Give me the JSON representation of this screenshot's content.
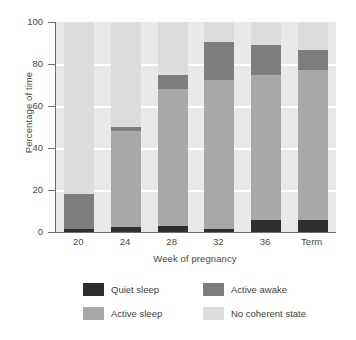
{
  "chart_data": {
    "type": "bar",
    "subtype": "stacked-bar",
    "title": "",
    "xlabel": "Week of pregnancy",
    "ylabel": "Percentage of time",
    "categories": [
      "20",
      "24",
      "28",
      "32",
      "36",
      "Term"
    ],
    "ylim": [
      0,
      100
    ],
    "yticks": [
      0,
      20,
      40,
      60,
      80,
      100
    ],
    "grid": true,
    "legend_position": "bottom",
    "series": [
      {
        "name": "Quiet sleep",
        "color": "#2e2e2e",
        "values": [
          1.5,
          2.5,
          3.0,
          1.2,
          5.5,
          5.5
        ]
      },
      {
        "name": "Active sleep",
        "color": "#a8a8a8",
        "values": [
          0,
          45.5,
          65.0,
          71.0,
          69.5,
          71.5
        ]
      },
      {
        "name": "Active awake",
        "color": "#7d7d7d",
        "values": [
          16.5,
          2.0,
          7.0,
          18.3,
          14.0,
          9.5
        ]
      },
      {
        "name": "No coherent state",
        "color": "#dcdcda",
        "values": [
          82.0,
          50.0,
          25.0,
          9.5,
          11.0,
          13.5
        ]
      }
    ],
    "stack_order": [
      "Quiet sleep",
      "Active sleep",
      "Active awake",
      "No coherent state"
    ],
    "bar_tops": {
      "quiet_sleep": [
        1.5,
        2.5,
        3.0,
        1.2,
        5.5,
        5.5
      ],
      "active_sleep": [
        1.5,
        48.0,
        68.0,
        72.2,
        75.0,
        77.0
      ],
      "active_awake": [
        18.0,
        50.0,
        75.0,
        90.5,
        89.0,
        86.5
      ],
      "no_coherent_state": [
        100,
        100,
        100,
        100,
        100,
        100
      ]
    }
  },
  "axes": {
    "y_title": "Percentage of time",
    "x_title": "Week of pregnancy",
    "y_tick_labels": [
      "100",
      "80",
      "60",
      "40",
      "20",
      "0"
    ],
    "x_tick_labels": [
      "20",
      "24",
      "28",
      "32",
      "36",
      "Term"
    ]
  },
  "legend": {
    "items": [
      {
        "label": "Quiet sleep",
        "color": "#2e2e2e"
      },
      {
        "label": "Active awake",
        "color": "#7d7d7d"
      },
      {
        "label": "Active sleep",
        "color": "#a8a8a8"
      },
      {
        "label": "No coherent state",
        "color": "#dcdcda"
      }
    ]
  },
  "style": {
    "plot_background": "#e9e9e7",
    "gridline_color": "#ffffff",
    "axis_color": "#6d6d6d",
    "page_background": "#ffffff"
  }
}
